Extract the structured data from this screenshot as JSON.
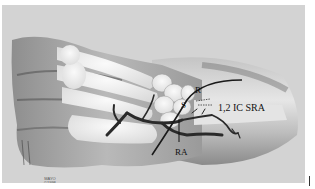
{
  "figure": {
    "type": "anatomical illustration",
    "labels": {
      "r": "R",
      "s": "S",
      "sra": "1,2 IC SRA",
      "ra": "RA"
    },
    "watermark": {
      "line1": "MAYO",
      "line2": "©1998"
    },
    "colors": {
      "background": "#d3d3d3",
      "bone": "#f2f2f2",
      "skin": "#a8a8a8",
      "shadow": "#5a5a5a",
      "artery": "#2a2a2a",
      "label": "#111111"
    }
  }
}
